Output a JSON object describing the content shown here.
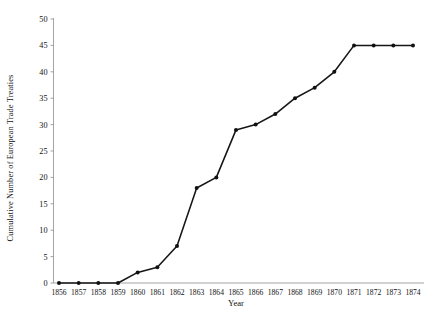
{
  "chart_data": {
    "type": "line",
    "title": "",
    "xlabel": "Year",
    "ylabel": "Cumulative Number of European Trade Treaties",
    "categories": [
      "1856",
      "1857",
      "1858",
      "1859",
      "1860",
      "1861",
      "1862",
      "1863",
      "1864",
      "1865",
      "1866",
      "1867",
      "1868",
      "1869",
      "1870",
      "1871",
      "1872",
      "1873",
      "1874"
    ],
    "values": [
      0,
      0,
      0,
      0,
      2,
      3,
      7,
      18,
      20,
      29,
      30,
      32,
      35,
      37,
      40,
      45,
      45,
      45,
      45
    ],
    "ylim": [
      0,
      50
    ],
    "yticks": [
      0,
      5,
      10,
      15,
      20,
      25,
      30,
      35,
      40,
      45,
      50
    ],
    "ytick_labels": [
      "0",
      "5",
      "10",
      "15",
      "20",
      "25",
      "30",
      "35",
      "40",
      "45",
      "50"
    ],
    "grid": false,
    "legend": false,
    "legend_position": "none",
    "series": [
      {
        "name": "Cumulative European Trade Treaties",
        "color": "#111111",
        "marker": "circle",
        "values": [
          0,
          0,
          0,
          0,
          2,
          3,
          7,
          18,
          20,
          29,
          30,
          32,
          35,
          37,
          40,
          45,
          45,
          45,
          45
        ]
      }
    ],
    "axis_color": "#9a9a9a",
    "background": "#ffffff"
  }
}
